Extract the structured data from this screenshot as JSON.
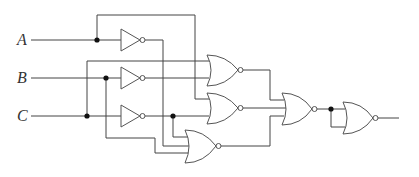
{
  "diagram": {
    "type": "logic-circuit",
    "inputs": [
      {
        "label": "A"
      },
      {
        "label": "B"
      },
      {
        "label": "C"
      }
    ],
    "gates": [
      {
        "id": "not-a",
        "type": "NOT",
        "input": "A"
      },
      {
        "id": "not-b",
        "type": "NOT",
        "input": "B"
      },
      {
        "id": "not-c",
        "type": "NOT",
        "input": "C"
      },
      {
        "id": "nor-1",
        "type": "NOR",
        "inputs": [
          "C",
          "B'"
        ]
      },
      {
        "id": "nor-2",
        "type": "NOR",
        "inputs": [
          "A",
          "C'"
        ]
      },
      {
        "id": "nor-3",
        "type": "NOR",
        "inputs": [
          "C'",
          "A'",
          "B"
        ]
      },
      {
        "id": "nor-4",
        "type": "NOR",
        "inputs": [
          "nor-1",
          "nor-2",
          "nor-3"
        ]
      },
      {
        "id": "nor-5",
        "type": "NOR",
        "inputs": [
          "nor-4",
          "nor-4"
        ]
      }
    ]
  }
}
